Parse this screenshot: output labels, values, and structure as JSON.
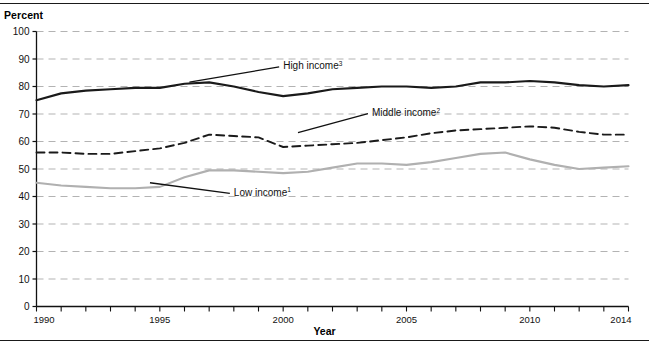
{
  "figure": {
    "percent_axis_title": "Percent",
    "year_axis_title": "Year"
  },
  "chart_data": {
    "type": "line",
    "title": "",
    "subtitle": "",
    "xlabel": "Year",
    "ylabel": "Percent",
    "xlim": [
      1990,
      2014
    ],
    "ylim": [
      0,
      100
    ],
    "grid": true,
    "grid_style": "dashed-horizontal",
    "grid_color": "#b3b3b3",
    "legend_position": "inline-annotations",
    "x": [
      1990,
      1991,
      1992,
      1993,
      1994,
      1995,
      1996,
      1997,
      1998,
      1999,
      2000,
      2001,
      2002,
      2003,
      2004,
      2005,
      2006,
      2007,
      2008,
      2009,
      2010,
      2011,
      2012,
      2013,
      2014
    ],
    "xticks_major": [
      1990,
      1995,
      2000,
      2005,
      2010,
      2014
    ],
    "xticks_minor_every": 1,
    "yticks": [
      0,
      10,
      20,
      30,
      40,
      50,
      60,
      70,
      80,
      90,
      100
    ],
    "series": [
      {
        "name": "High income",
        "footnote_marker": "3",
        "label": "High income",
        "style": "solid",
        "color": "#1a1a1a",
        "width": 2.1,
        "values": [
          75,
          77.5,
          78.5,
          79,
          79.5,
          79.5,
          81,
          81.5,
          80,
          78,
          76.5,
          77.5,
          79,
          79.5,
          80,
          80,
          79.5,
          80,
          81.5,
          81.5,
          82,
          81.5,
          80.5,
          80,
          80.5
        ],
        "annotation": {
          "text_x": 2000.0,
          "text_y": 87.5,
          "leader_from_x": 1996.2,
          "leader_from_y": 81.6
        }
      },
      {
        "name": "Middle income",
        "footnote_marker": "2",
        "label": "Middle income",
        "style": "dashed",
        "color": "#1a1a1a",
        "width": 1.9,
        "values": [
          56,
          56,
          55.5,
          55.5,
          56.5,
          57.5,
          59.5,
          62.5,
          62,
          61.5,
          58,
          58.5,
          59,
          59.5,
          60.5,
          61.5,
          63,
          64,
          64.5,
          65,
          65.5,
          65,
          63.5,
          62.5,
          62.5
        ],
        "annotation": {
          "text_x": 2003.6,
          "text_y": 70.5,
          "leader_from_x": 2000.6,
          "leader_from_y": 63.2
        }
      },
      {
        "name": "Low income",
        "footnote_marker": "1",
        "label": "Low income",
        "style": "solid",
        "color": "#b0b0b0",
        "width": 2.1,
        "values": [
          45,
          44,
          43.5,
          43,
          43,
          43.5,
          47,
          49.5,
          49.5,
          49,
          48.5,
          49,
          50.5,
          52,
          52,
          51.5,
          52.5,
          54,
          55.5,
          56,
          53.5,
          51.5,
          50,
          50.5,
          51
        ],
        "annotation": {
          "text_x": 1998.0,
          "text_y": 41.5,
          "leader_from_x": 1994.6,
          "leader_from_y": 45.0
        }
      }
    ]
  }
}
